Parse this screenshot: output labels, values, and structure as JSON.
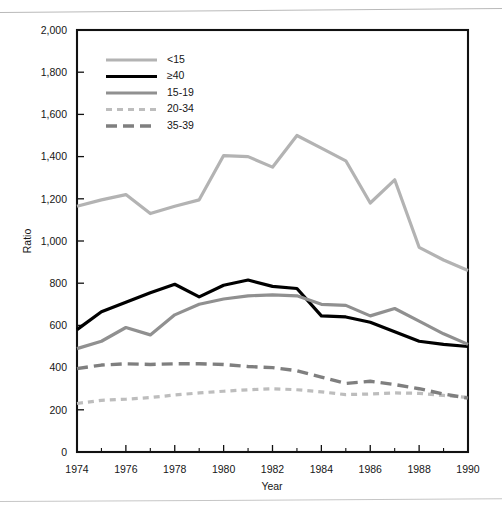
{
  "figure": {
    "background": "#ffffff",
    "frame_color": "#111111"
  },
  "chart_data": {
    "type": "line",
    "title": "",
    "xlabel": "Year",
    "ylabel": "Ratio",
    "xlim": [
      1974,
      1990
    ],
    "ylim": [
      0,
      2000
    ],
    "ytick_step": 200,
    "xtick_step": 2,
    "grid": false,
    "legend_position": "top-left-inside",
    "xticks": [
      1974,
      1976,
      1978,
      1980,
      1982,
      1984,
      1986,
      1988,
      1990
    ],
    "xtick_labels": [
      "1974",
      "1976",
      "1978",
      "1980",
      "1982",
      "1984",
      "1986",
      "1988",
      "1990"
    ],
    "xticks_minor": [
      1975,
      1977,
      1979,
      1981,
      1983,
      1985,
      1987,
      1989
    ],
    "yticks": [
      0,
      200,
      400,
      600,
      800,
      1000,
      1200,
      1400,
      1600,
      1800,
      2000
    ],
    "ytick_labels": [
      "0",
      "200",
      "400",
      "600",
      "800",
      "1,000",
      "1,200",
      "1,400",
      "1,600",
      "1,800",
      "2,000"
    ],
    "x": [
      1974,
      1975,
      1976,
      1977,
      1978,
      1979,
      1980,
      1981,
      1982,
      1983,
      1984,
      1985,
      1986,
      1987,
      1988,
      1989,
      1990
    ],
    "series": [
      {
        "name": "<15",
        "color": "#b3b3b3",
        "width": 3.2,
        "dash": "none",
        "values": [
          1165,
          1195,
          1220,
          1130,
          1165,
          1195,
          1405,
          1400,
          1350,
          1500,
          1440,
          1380,
          1180,
          1290,
          970,
          910,
          860
        ]
      },
      {
        "name": "≥40",
        "color": "#000000",
        "width": 3.2,
        "dash": "none",
        "values": [
          580,
          665,
          710,
          755,
          795,
          735,
          790,
          815,
          785,
          775,
          645,
          640,
          615,
          570,
          525,
          510,
          500
        ]
      },
      {
        "name": "15-19",
        "color": "#909090",
        "width": 3.2,
        "dash": "none",
        "values": [
          490,
          525,
          590,
          555,
          650,
          700,
          725,
          740,
          745,
          740,
          700,
          695,
          645,
          680,
          620,
          560,
          510
        ]
      },
      {
        "name": "20-34",
        "color": "#bdbdbd",
        "width": 3.2,
        "dash": "6 5",
        "values": [
          230,
          245,
          250,
          258,
          270,
          280,
          288,
          295,
          300,
          295,
          285,
          272,
          275,
          280,
          278,
          268,
          258
        ]
      },
      {
        "name": "35-39",
        "color": "#7f7f7f",
        "width": 3.4,
        "dash": "11 6",
        "values": [
          395,
          412,
          418,
          415,
          418,
          418,
          415,
          405,
          400,
          385,
          355,
          325,
          335,
          320,
          300,
          275,
          255
        ]
      }
    ]
  }
}
